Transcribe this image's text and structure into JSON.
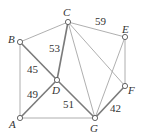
{
  "graph": {
    "nodes": [
      {
        "id": "A",
        "label": "A",
        "x": 20,
        "y": 118,
        "lx": 9,
        "ly": 128
      },
      {
        "id": "B",
        "label": "B",
        "x": 20,
        "y": 42,
        "lx": 8,
        "ly": 43
      },
      {
        "id": "C",
        "label": "C",
        "x": 68,
        "y": 22,
        "lx": 63,
        "ly": 16
      },
      {
        "id": "D",
        "label": "D",
        "x": 57,
        "y": 80,
        "lx": 52,
        "ly": 94
      },
      {
        "id": "E",
        "label": "E",
        "x": 125,
        "y": 37,
        "lx": 122,
        "ly": 33
      },
      {
        "id": "F",
        "label": "F",
        "x": 125,
        "y": 86,
        "lx": 128,
        "ly": 94
      },
      {
        "id": "G",
        "label": "G",
        "x": 95,
        "y": 118,
        "lx": 90,
        "ly": 132
      }
    ],
    "edges": [
      {
        "from": "B",
        "to": "C",
        "weight": null,
        "highlight": false
      },
      {
        "from": "C",
        "to": "E",
        "weight": "59",
        "highlight": false,
        "wx": 95,
        "wy": 25
      },
      {
        "from": "A",
        "to": "B",
        "weight": null,
        "highlight": false
      },
      {
        "from": "B",
        "to": "D",
        "weight": "45",
        "highlight": true,
        "wx": 27,
        "wy": 73
      },
      {
        "from": "C",
        "to": "D",
        "weight": "53",
        "highlight": true,
        "wx": 49,
        "wy": 52
      },
      {
        "from": "A",
        "to": "D",
        "weight": "49",
        "highlight": true,
        "wx": 27,
        "wy": 98
      },
      {
        "from": "D",
        "to": "G",
        "weight": "51",
        "highlight": true,
        "wx": 63,
        "wy": 108
      },
      {
        "from": "A",
        "to": "G",
        "weight": null,
        "highlight": false
      },
      {
        "from": "C",
        "to": "G",
        "weight": null,
        "highlight": false
      },
      {
        "from": "C",
        "to": "F",
        "weight": null,
        "highlight": false
      },
      {
        "from": "E",
        "to": "G",
        "weight": null,
        "highlight": false
      },
      {
        "from": "E",
        "to": "F",
        "weight": null,
        "highlight": false
      },
      {
        "from": "F",
        "to": "G",
        "weight": "42",
        "highlight": true,
        "wx": 110,
        "wy": 112
      }
    ]
  }
}
